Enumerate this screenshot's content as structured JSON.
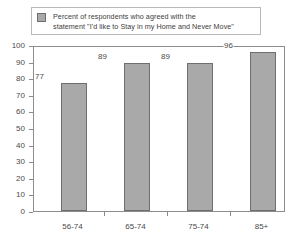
{
  "chart_data": {
    "type": "bar",
    "title": "",
    "xlabel": "",
    "ylabel": "",
    "categories": [
      "56-74",
      "65-74",
      "75-74",
      "85+"
    ],
    "values": [
      77,
      89,
      89,
      96
    ],
    "ylim": [
      0,
      100
    ],
    "ytick_step": 10,
    "yticks": [
      "100",
      "90",
      "80",
      "70",
      "60",
      "50",
      "40",
      "30",
      "20",
      "10",
      "0"
    ],
    "grid": false,
    "legend_position": "top",
    "series": [
      {
        "name": "Percent of respondents who agreed with the statement \"I'd like to Stay in my Home and Never Move\"",
        "values": [
          77,
          89,
          89,
          96
        ]
      }
    ],
    "bar_color": "#a9a9a9",
    "bar_border_color": "#6e6e6e",
    "axis_color": "#8c8c8c"
  },
  "legend": {
    "swatch_name": "legend-swatch",
    "line1": "Percent of respondents who agreed with the",
    "line2": "statement \"I'd like to Stay in my Home and Never Move\""
  }
}
